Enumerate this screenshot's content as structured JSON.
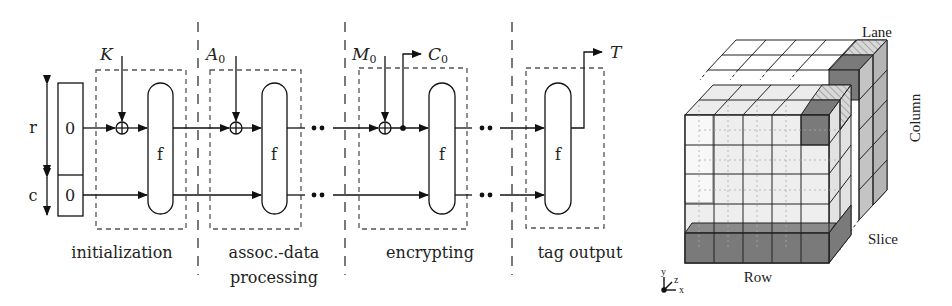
{
  "sponge_diagram": {
    "register": {
      "rate_label": "r",
      "capacity_label": "c",
      "rate_init_value": "0",
      "capacity_init_value": "0"
    },
    "inputs": {
      "key": "K",
      "assoc_data": "A",
      "assoc_data_sub": "0",
      "message": "M",
      "message_sub": "0"
    },
    "outputs": {
      "ciphertext": "C",
      "ciphertext_sub": "0",
      "tag": "T"
    },
    "permutation_label": "f",
    "phases": [
      {
        "label_line1": "initialization",
        "label_line2": ""
      },
      {
        "label_line1": "assoc.-data",
        "label_line2": "processing"
      },
      {
        "label_line1": "encrypting",
        "label_line2": ""
      },
      {
        "label_line1": "tag output",
        "label_line2": ""
      }
    ]
  },
  "state_cube": {
    "labels": {
      "lane": "Lane",
      "column": "Column",
      "slice": "Slice",
      "row": "Row"
    },
    "axes": {
      "x": "x",
      "y": "y",
      "z": "z"
    },
    "grid_size": 5,
    "colors": {
      "dark": "#7a7a7a",
      "light": "#e6e6e6",
      "mid": "#b9b9b9",
      "line": "#222222"
    }
  }
}
